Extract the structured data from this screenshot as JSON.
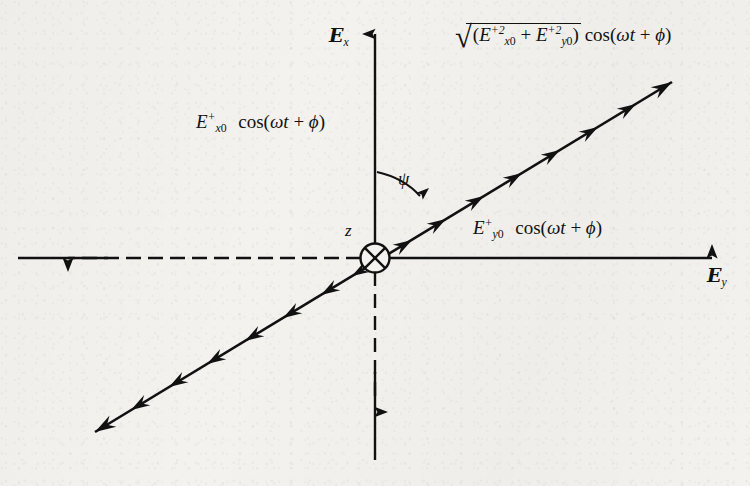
{
  "figure": {
    "background_color": "#f3f2ef",
    "ink_color": "#111111"
  },
  "axes": {
    "vertical": {
      "name": "x-axis",
      "label_glyph": "E",
      "label_subscript": "x",
      "positive_style": "solid-with-arrow",
      "negative_style": "dashed-with-arrow"
    },
    "horizontal": {
      "name": "y-axis",
      "label_glyph": "E",
      "label_subscript": "y",
      "positive_style": "solid-with-arrow",
      "negative_style": "dashed-with-arrow"
    },
    "propagation": {
      "name": "z-axis",
      "label": "z",
      "marker": "circle-with-cross",
      "meaning": "into-page"
    }
  },
  "angle": {
    "symbol": "ψ",
    "measured_from": "x-axis",
    "measured_to": "resultant-field-line"
  },
  "labels": {
    "x_component": {
      "base": "E",
      "subscript": "x",
      "subscript_zero": "0",
      "superscript": "+",
      "factor": "cos",
      "argument_open": "(",
      "omega": "ω",
      "time": "t",
      "plus": "+",
      "phase": "ϕ",
      "argument_close": ")"
    },
    "y_component": {
      "base": "E",
      "subscript": "y",
      "subscript_zero": "0",
      "superscript": "+",
      "factor": "cos",
      "argument_open": "(",
      "omega": "ω",
      "time": "t",
      "plus": "+",
      "phase": "ϕ",
      "argument_close": ")"
    },
    "resultant": {
      "radical": "√",
      "open_paren": "(",
      "term1_base": "E",
      "term1_sub": "x",
      "term1_sub_zero": "0",
      "term1_sup": "+2",
      "plus_inner": "+",
      "term2_base": "E",
      "term2_sub": "y",
      "term2_sub_zero": "0",
      "term2_sup": "+2",
      "close_paren": ")",
      "factor": "cos",
      "argument_open": "(",
      "omega": "ω",
      "time": "t",
      "plus": "+",
      "phase": "ϕ",
      "argument_close": ")"
    }
  },
  "resultant_line": {
    "name": "resultant-field-vector",
    "style": "double-headed-barbed",
    "barb_count": 16,
    "endpoint_upper_right": [
      672,
      82
    ],
    "endpoint_lower_left": [
      95,
      432
    ],
    "origin": [
      375,
      258
    ]
  }
}
